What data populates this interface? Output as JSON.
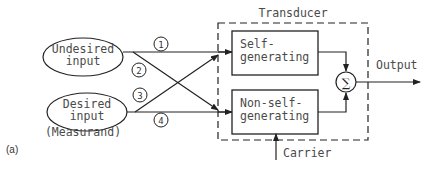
{
  "figure_label": "(a)",
  "inputs": {
    "undesired": {
      "line1": "Undesired",
      "line2": "input"
    },
    "desired": {
      "line1": "Desired",
      "line2": "input",
      "note": "(Measurand)"
    }
  },
  "paths": [
    {
      "id": "1",
      "from": "Undesired input",
      "to": "Self-generating"
    },
    {
      "id": "2",
      "from": "Undesired input",
      "to": "Non-self-generating"
    },
    {
      "id": "3",
      "from": "Desired input",
      "to": "Self-generating"
    },
    {
      "id": "4",
      "from": "Desired input",
      "to": "Non-self-generating"
    }
  ],
  "transducer": {
    "title": "Transducer",
    "self_generating": {
      "line1": "Self-",
      "line2": "generating"
    },
    "non_self_generating": {
      "line1": "Non-self-",
      "line2": "generating"
    },
    "summer_symbol": "∑"
  },
  "output_label": "Output",
  "carrier_label": "Carrier",
  "colors": {
    "stroke": "#222222",
    "text": "#4a4a4a",
    "background": "#ffffff"
  }
}
